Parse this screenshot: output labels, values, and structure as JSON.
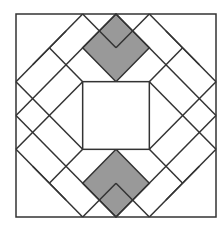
{
  "diagram": {
    "title": "",
    "colors": {
      "stroke": "#333333",
      "fill_white": "#ffffff",
      "fill_grey": "#999999",
      "background": "#ffffff"
    },
    "grid": {
      "origin_x": 16,
      "origin_y": 14,
      "unit": 33.33,
      "size": 6
    },
    "center_square": {
      "x": 2,
      "y": 2,
      "w": 2,
      "h": 2
    },
    "grey_diamonds": [
      {
        "name": "top",
        "points": [
          [
            3,
            0
          ],
          [
            4,
            1
          ],
          [
            3,
            2
          ],
          [
            2,
            1
          ]
        ]
      },
      {
        "name": "bottom",
        "points": [
          [
            3,
            4
          ],
          [
            4,
            5
          ],
          [
            3,
            6
          ],
          [
            2,
            5
          ]
        ]
      }
    ],
    "lines": [
      [
        [
          2,
          0
        ],
        [
          0,
          2
        ]
      ],
      [
        [
          4,
          0
        ],
        [
          6,
          2
        ]
      ],
      [
        [
          0,
          4
        ],
        [
          2,
          6
        ]
      ],
      [
        [
          6,
          4
        ],
        [
          4,
          6
        ]
      ],
      [
        [
          3,
          0
        ],
        [
          0,
          3
        ]
      ],
      [
        [
          3,
          0
        ],
        [
          6,
          3
        ]
      ],
      [
        [
          0,
          3
        ],
        [
          3,
          6
        ]
      ],
      [
        [
          6,
          3
        ],
        [
          3,
          6
        ]
      ],
      [
        [
          2,
          0
        ],
        [
          3,
          1
        ]
      ],
      [
        [
          4,
          0
        ],
        [
          3,
          1
        ]
      ],
      [
        [
          2,
          6
        ],
        [
          3,
          5
        ]
      ],
      [
        [
          4,
          6
        ],
        [
          3,
          5
        ]
      ],
      [
        [
          0,
          2
        ],
        [
          2,
          4
        ]
      ],
      [
        [
          0,
          4
        ],
        [
          2,
          2
        ]
      ],
      [
        [
          6,
          2
        ],
        [
          4,
          4
        ]
      ],
      [
        [
          6,
          4
        ],
        [
          4,
          2
        ]
      ],
      [
        [
          1,
          1
        ],
        [
          2,
          2
        ]
      ],
      [
        [
          5,
          1
        ],
        [
          4,
          2
        ]
      ],
      [
        [
          1,
          5
        ],
        [
          2,
          4
        ]
      ],
      [
        [
          5,
          5
        ],
        [
          4,
          4
        ]
      ],
      [
        [
          1.5,
          0.5
        ],
        [
          0.5,
          1.5
        ]
      ],
      [
        [
          4.5,
          0.5
        ],
        [
          5.5,
          1.5
        ]
      ],
      [
        [
          0.5,
          4.5
        ],
        [
          1.5,
          5.5
        ]
      ],
      [
        [
          5.5,
          4.5
        ],
        [
          4.5,
          5.5
        ]
      ]
    ]
  }
}
